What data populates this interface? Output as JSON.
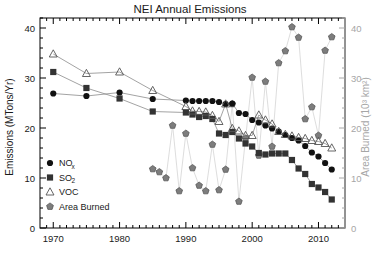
{
  "chart_data": {
    "type": "line",
    "title": "NEI Annual Emissions",
    "xlabel": "",
    "ylabel": "Emissions (MTons/Yr)",
    "y2label": "Area Burned (10³ km²)",
    "xlim": [
      1968,
      2014
    ],
    "ylim": [
      0,
      42
    ],
    "y2lim": [
      0,
      42
    ],
    "xticks": [
      1970,
      1980,
      1990,
      2000,
      2010
    ],
    "xtick_labels": [
      "1970",
      "1980",
      "1990",
      "2000",
      "2010"
    ],
    "yticks": [
      0,
      10,
      20,
      30,
      40
    ],
    "ytick_labels": [
      "0",
      "10",
      "20",
      "30",
      "40"
    ],
    "y2ticks": [
      0,
      10,
      20,
      30,
      40
    ],
    "y2tick_labels": [
      "0",
      "10",
      "20",
      "30",
      "40"
    ],
    "grid": false,
    "legend_position": "lower-left",
    "colors": {
      "nox": "#111111",
      "so2": "#333333",
      "voc": "#555555",
      "area_burned_marker": "#7d7d7d",
      "area_burned_line": "#d9d9d9",
      "right_axis": "#a6a6a6",
      "frame": "#000000",
      "background": "#ffffff"
    },
    "series": [
      {
        "name": "NOₓ",
        "legend_label": "NO",
        "legend_sub": "x",
        "marker": "filled-circle",
        "axis": "left",
        "x": [
          1970,
          1975,
          1980,
          1985,
          1990,
          1991,
          1992,
          1993,
          1994,
          1995,
          1996,
          1997,
          1998,
          1999,
          2000,
          2001,
          2002,
          2003,
          2004,
          2005,
          2006,
          2007,
          2008,
          2009,
          2010,
          2011,
          2012
        ],
        "values": [
          26.9,
          26.4,
          27.1,
          25.8,
          25.5,
          25.4,
          25.4,
          25.4,
          25.4,
          25.2,
          24.8,
          24.9,
          23.0,
          22.8,
          21.6,
          21.1,
          20.5,
          19.9,
          19.3,
          18.6,
          18.0,
          17.5,
          16.4,
          15.1,
          14.3,
          13.0,
          11.7
        ]
      },
      {
        "name": "SO₂",
        "legend_label": "SO",
        "legend_sub": "2",
        "marker": "filled-square",
        "axis": "left",
        "x": [
          1970,
          1975,
          1980,
          1985,
          1990,
          1991,
          1992,
          1993,
          1994,
          1995,
          1996,
          1997,
          1998,
          1999,
          2000,
          2001,
          2002,
          2003,
          2004,
          2005,
          2006,
          2007,
          2008,
          2009,
          2010,
          2011,
          2012
        ],
        "values": [
          31.2,
          28.0,
          25.9,
          23.3,
          23.1,
          22.7,
          22.2,
          22.4,
          21.8,
          18.9,
          18.6,
          19.2,
          17.9,
          16.9,
          16.3,
          15.0,
          14.7,
          14.9,
          14.9,
          14.9,
          13.6,
          11.9,
          10.8,
          8.8,
          8.1,
          7.2,
          5.7
        ]
      },
      {
        "name": "VOC",
        "legend_label": "VOC",
        "legend_sub": "",
        "marker": "open-triangle",
        "axis": "left",
        "x": [
          1970,
          1975,
          1980,
          1985,
          1990,
          1991,
          1992,
          1993,
          1994,
          1995,
          1996,
          1997,
          1998,
          1999,
          2000,
          2001,
          2002,
          2003,
          2004,
          2005,
          2006,
          2007,
          2008,
          2009,
          2010,
          2011,
          2012
        ],
        "values": [
          34.8,
          30.9,
          31.2,
          27.5,
          24.3,
          23.4,
          23.3,
          23.2,
          22.5,
          21.3,
          24.8,
          19.9,
          19.4,
          18.5,
          18.5,
          22.6,
          21.6,
          20.8,
          19.3,
          18.7,
          18.4,
          18.1,
          17.9,
          17.5,
          17.3,
          16.9,
          16.0
        ]
      },
      {
        "name": "Area Burned",
        "legend_label": "Area Burned",
        "legend_sub": "",
        "marker": "filled-pentagon",
        "axis": "right",
        "x": [
          1985,
          1986,
          1987,
          1988,
          1989,
          1990,
          1991,
          1992,
          1993,
          1994,
          1995,
          1996,
          1997,
          1998,
          1999,
          2000,
          2001,
          2002,
          2003,
          2004,
          2005,
          2006,
          2007,
          2008,
          2009,
          2010,
          2011,
          2012
        ],
        "values": [
          11.8,
          11.2,
          10.0,
          20.5,
          7.4,
          18.9,
          12.0,
          8.5,
          7.4,
          16.7,
          7.6,
          11.7,
          24.8,
          5.3,
          17.9,
          30.1,
          14.5,
          29.3,
          16.3,
          33.0,
          35.4,
          40.2,
          38.1,
          21.8,
          24.2,
          18.5,
          35.5,
          38.2
        ]
      }
    ]
  },
  "legend": {
    "items": [
      {
        "label": "NO",
        "sub": "x",
        "marker": "filled-circle"
      },
      {
        "label": "SO",
        "sub": "2",
        "marker": "filled-square"
      },
      {
        "label": "VOC",
        "sub": "",
        "marker": "open-triangle"
      },
      {
        "label": "Area Burned",
        "sub": "",
        "marker": "filled-pentagon"
      }
    ]
  }
}
